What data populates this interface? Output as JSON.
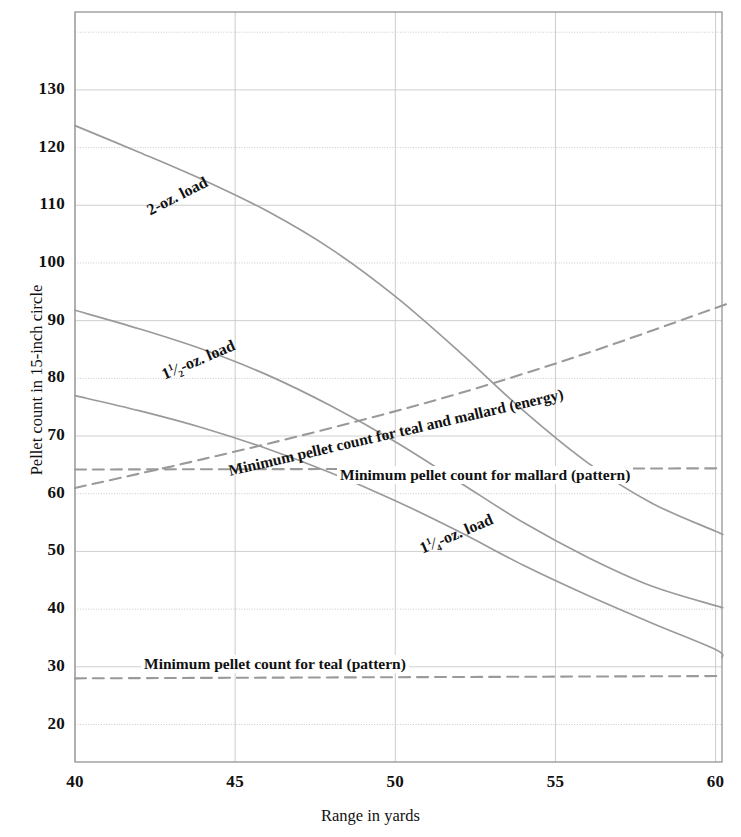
{
  "chart_data": {
    "type": "line",
    "title": "",
    "xlabel": "Range in yards",
    "ylabel": "Pellet count in 15-inch circle",
    "xlim": [
      40,
      60.2
    ],
    "ylim": [
      13.5,
      143.5
    ],
    "xticks": [
      40,
      45,
      50,
      55,
      60
    ],
    "xtick_labels": [
      "40",
      "45",
      "50",
      "55",
      "60"
    ],
    "yticks": [
      20,
      30,
      40,
      50,
      60,
      70,
      80,
      90,
      100,
      110,
      120,
      130,
      140
    ],
    "ytick_labels": [
      "20",
      "30",
      "40",
      "50",
      "60",
      "70",
      "80",
      "90",
      "100",
      "110",
      "120",
      "130",
      ""
    ],
    "grid": true,
    "legend_position": "inline-annotations",
    "line_color": "#9a9a9a",
    "grid_color": "#c8c8c8",
    "axis_color": "#8d8d8d",
    "series": [
      {
        "name": "2-oz. load",
        "style": "solid",
        "label_text_parts": {
          "lead": "2-oz. load"
        },
        "label_rotation": -27,
        "x": [
          40,
          42,
          44,
          46,
          48,
          50,
          52,
          54,
          56,
          58,
          60,
          60.2
        ],
        "y": [
          123.8,
          119.2,
          114.4,
          109.0,
          102.4,
          94.2,
          84.6,
          74.4,
          65.4,
          58.4,
          53.5,
          53.0
        ]
      },
      {
        "name": "1½-oz. load",
        "style": "solid",
        "label_text_parts": {
          "whole": "1",
          "num": "1",
          "den": "2",
          "tail": "-oz. load"
        },
        "label_rotation": -23,
        "x": [
          40,
          42,
          44,
          46,
          48,
          50,
          52,
          54,
          56,
          58,
          60,
          60.2
        ],
        "y": [
          91.8,
          88.6,
          85.0,
          80.6,
          75.2,
          69.0,
          62.0,
          55.0,
          49.0,
          44.0,
          40.6,
          40.3
        ]
      },
      {
        "name": "1¼-oz. load",
        "style": "solid",
        "label_text_parts": {
          "whole": "1",
          "num": "1",
          "den": "4",
          "tail": "-oz. load"
        },
        "label_rotation": -23,
        "x": [
          40,
          42,
          44,
          46,
          48,
          50,
          52,
          54,
          56,
          58,
          60,
          60.2
        ],
        "y": [
          77.0,
          74.4,
          71.4,
          67.8,
          63.6,
          58.8,
          53.4,
          47.6,
          42.4,
          37.6,
          33.0,
          31.6
        ]
      },
      {
        "name": "Minimum pellet count for teal and mallard (energy)",
        "style": "dashed",
        "label_rotation": -13,
        "x": [
          40,
          44,
          48,
          52,
          56,
          60,
          60.2
        ],
        "y": [
          61.0,
          66.0,
          71.4,
          77.4,
          84.4,
          92.2,
          92.6
        ]
      },
      {
        "name": "Minimum pellet count for mallard (pattern)",
        "style": "dashed",
        "label_rotation": 0,
        "x": [
          40,
          60.2
        ],
        "y": [
          64.2,
          64.4
        ]
      },
      {
        "name": "Minimum pellet count for teal (pattern)",
        "style": "dashed",
        "label_rotation": 0,
        "x": [
          40,
          60.2
        ],
        "y": [
          28.0,
          28.4
        ]
      }
    ]
  },
  "axes": {
    "x_label": "Range in yards",
    "y_label": "Pellet count in 15-inch circle"
  },
  "annotations": {
    "two_oz": "2-oz. load",
    "one_half_oz_whole": "1",
    "one_half_oz_num": "1",
    "one_half_oz_den": "2",
    "one_half_oz_tail": "-oz. load",
    "one_quarter_oz_whole": "1",
    "one_quarter_oz_num": "1",
    "one_quarter_oz_den": "4",
    "one_quarter_oz_tail": "-oz. load",
    "energy_line": "Minimum pellet count for teal and mallard (energy)",
    "mallard_pattern": "Minimum pellet count for mallard (pattern)",
    "teal_pattern": "Minimum pellet count for teal (pattern)"
  }
}
